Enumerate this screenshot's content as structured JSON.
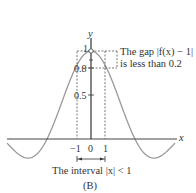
{
  "chart_data": {
    "type": "line",
    "function": "f(x) = sin(x)/x",
    "title": "",
    "panel_label": "(B)",
    "xlabel": "x",
    "ylabel": "y",
    "x_ticks": [
      "-1",
      "0",
      "1"
    ],
    "y_ticks": [
      "0.5",
      "0.8",
      "1"
    ],
    "xlim": [
      -6.5,
      7.5
    ],
    "ylim": [
      -0.25,
      1.1
    ],
    "grid": false,
    "series": [
      {
        "name": "f(x) = sin(x)/x",
        "x": [
          -6.5,
          -6,
          -5.5,
          -5,
          -4.5,
          -4,
          -3.5,
          -3.1416,
          -3,
          -2.5,
          -2,
          -1.5,
          -1,
          -0.5,
          0,
          0.5,
          1,
          1.5,
          2,
          2.5,
          3,
          3.1416,
          3.5,
          4,
          4.5,
          5,
          5.5,
          6,
          6.5
        ],
        "values": [
          0.033,
          0.047,
          0.128,
          0.192,
          0.217,
          0.189,
          0.1,
          0.0,
          0.047,
          0.239,
          0.455,
          0.665,
          0.841,
          0.959,
          1.0,
          0.959,
          0.841,
          0.665,
          0.455,
          0.239,
          0.047,
          0.0,
          -0.1,
          -0.189,
          -0.217,
          -0.192,
          -0.128,
          -0.047,
          0.033
        ]
      }
    ],
    "annotations": [
      {
        "type": "open-circle",
        "at": [
          0,
          1
        ],
        "note": "f(0) undefined"
      },
      {
        "type": "dashed-box",
        "x_range": [
          -1,
          1
        ],
        "y_range": [
          0.8,
          1
        ],
        "label": "The gap |f(x) − 1| is less than 0.2"
      },
      {
        "type": "bracket",
        "x_range": [
          -1,
          1
        ],
        "label": "The interval |x| < 1"
      }
    ]
  },
  "labels": {
    "y_axis": "y",
    "x_axis": "x",
    "y_tick_1": "1",
    "y_tick_08": "0.8",
    "y_tick_05": "0.5",
    "x_tick_neg1": "−1",
    "x_tick_0": "0",
    "x_tick_1": "1",
    "gap_line1": "The gap |f(x) − 1|",
    "gap_line2": "is less than 0.2",
    "interval": "The interval |x| < 1",
    "panel": "(B)"
  },
  "colors": {
    "curve": "#9a9a9a",
    "axes": "#333333",
    "dashes": "#555555"
  }
}
